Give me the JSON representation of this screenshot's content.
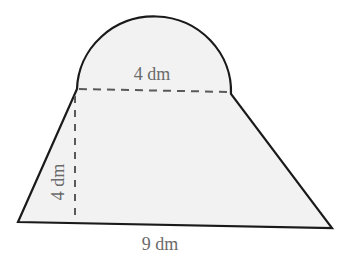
{
  "figure": {
    "type": "composite-shape",
    "colors": {
      "fill": "#f2f2f2",
      "outline": "#1a1a1a",
      "dashed": "#5a5a5a",
      "label": "#6a6a6a"
    },
    "labels": {
      "semicircle_diameter": "4 dm",
      "height": "4 dm",
      "bottom_base": "9 dm"
    },
    "dimensions": {
      "semicircle_diameter_dm": 4,
      "trapezoid_height_dm": 4,
      "trapezoid_bottom_base_dm": 9,
      "trapezoid_top_base_dm": 4
    }
  }
}
